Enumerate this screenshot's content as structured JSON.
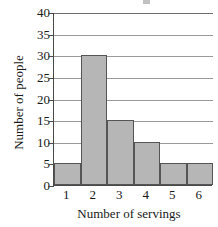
{
  "chart_data": {
    "type": "bar",
    "title": "",
    "xlabel": "Number of servings",
    "ylabel": "Number of people",
    "categories": [
      "1",
      "2",
      "3",
      "4",
      "5",
      "6"
    ],
    "values": [
      5,
      30,
      15,
      10,
      5,
      5
    ],
    "ylim": [
      0,
      40
    ],
    "ytick_labels": [
      "40",
      "35",
      "30",
      "25",
      "20",
      "15",
      "10",
      "5",
      "0"
    ],
    "ytick_values": [
      40,
      35,
      30,
      25,
      20,
      15,
      10,
      5,
      0
    ],
    "ytick_step": 5,
    "grid": "horizontal",
    "legend": "none",
    "bar_fill_color": "#b6b6b6",
    "bar_edge_color": "#555555",
    "gridline_color": "#9a9a9a",
    "axis_color": "#4a4a4a",
    "background_color": "#ffffff"
  }
}
